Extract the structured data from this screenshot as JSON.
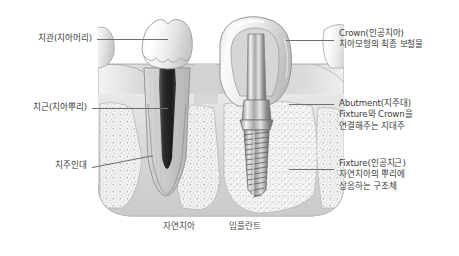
{
  "diagram": {
    "background_color": "#ffffff",
    "line_color": "#6e6e6e",
    "text_color": "#3a3a3a"
  },
  "labels_left": [
    {
      "id": "crown-natural",
      "lines": [
        "치관(치아머리)"
      ]
    },
    {
      "id": "root-natural",
      "lines": [
        "치근(치아뿌리)"
      ]
    },
    {
      "id": "periodontal-ligament",
      "lines": [
        "치주인대"
      ]
    }
  ],
  "labels_right": [
    {
      "id": "crown-implant",
      "lines": [
        "Crown(인공치아)",
        "치아모형의 최종 보철물"
      ]
    },
    {
      "id": "abutment",
      "lines": [
        "Abutment(지주대)",
        "Fixture와 Crown을",
        "연결해주는 지대주"
      ]
    },
    {
      "id": "fixture",
      "lines": [
        "Fixture(인공치근)",
        "자연치아의 뿌리에",
        "상응하는 구조체"
      ]
    }
  ],
  "captions": [
    {
      "id": "natural-tooth",
      "text": "자연치아"
    },
    {
      "id": "implant",
      "text": "임플란트"
    }
  ]
}
